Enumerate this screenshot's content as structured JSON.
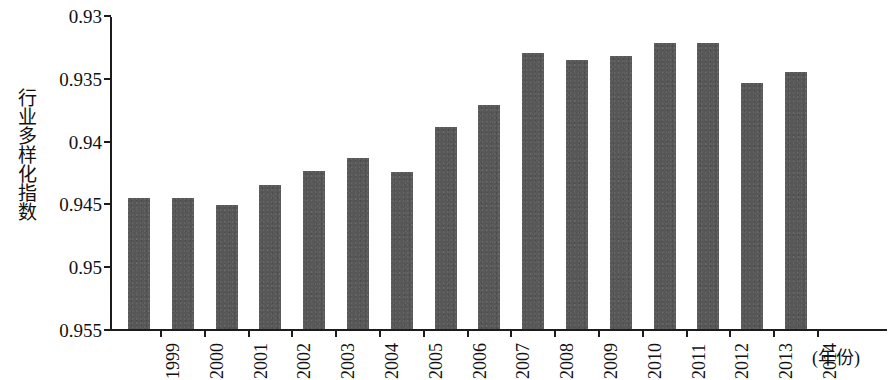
{
  "chart_data": {
    "type": "bar",
    "title": "",
    "xlabel": "(年份)",
    "ylabel": "行业多样化指数",
    "categories": [
      "1999",
      "2000",
      "2001",
      "2002",
      "2003",
      "2004",
      "2005",
      "2006",
      "2007",
      "2008",
      "2009",
      "2010",
      "2011",
      "2012",
      "2013",
      "2014"
    ],
    "values": [
      0.9404,
      0.9404,
      0.9399,
      0.9415,
      0.9426,
      0.9436,
      0.9425,
      0.9461,
      0.9478,
      0.952,
      0.9514,
      0.9517,
      0.9528,
      0.9528,
      0.9496,
      0.9505
    ],
    "ylim": [
      0.93,
      0.955
    ],
    "ytick_labels": [
      "0.955",
      "0.95",
      "0.945",
      "0.94",
      "0.935",
      "0.93"
    ],
    "ytick_values": [
      0.955,
      0.95,
      0.945,
      0.94,
      0.935,
      0.93
    ],
    "grid": false,
    "legend": null,
    "bar_color": "#575757",
    "axis_color": "#1c1c1c",
    "background": "#ffffff"
  },
  "axes": {
    "y_title": "行业多样化指数",
    "x_caption": "(年份)"
  }
}
